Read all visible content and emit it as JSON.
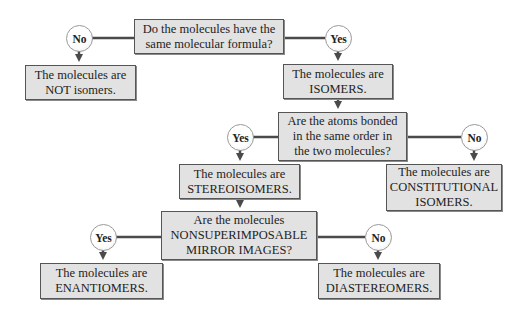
{
  "colors": {
    "box_fill": "#e2e2e2",
    "box_border": "#555555",
    "line": "#4a4a4a",
    "circle_fill": "#ffffff",
    "circle_border": "#9a9a9a",
    "text": "#222222"
  },
  "nodes": {
    "q1": {
      "lines": [
        "Do the molecules have the",
        "same molecular formula?"
      ]
    },
    "q1_no": {
      "label": "No"
    },
    "q1_yes": {
      "label": "Yes"
    },
    "not_isomers": {
      "lines": [
        "The molecules are",
        "NOT isomers."
      ]
    },
    "isomers": {
      "lines": [
        "The molecules are",
        "ISOMERS."
      ]
    },
    "q2": {
      "lines": [
        "Are the atoms bonded",
        "in the same order in",
        "the two molecules?"
      ]
    },
    "q2_yes": {
      "label": "Yes"
    },
    "q2_no": {
      "label": "No"
    },
    "stereoisomers": {
      "lines": [
        "The molecules are",
        "STEREOISOMERS."
      ]
    },
    "constitutional": {
      "lines": [
        "The molecules are",
        "CONSTITUTIONAL",
        "ISOMERS."
      ]
    },
    "q3": {
      "lines": [
        "Are the molecules",
        "NONSUPERIMPOSABLE",
        "MIRROR IMAGES?"
      ]
    },
    "q3_yes": {
      "label": "Yes"
    },
    "q3_no": {
      "label": "No"
    },
    "enantiomers": {
      "lines": [
        "The molecules are",
        "ENANTIOMERS."
      ]
    },
    "diastereomers": {
      "lines": [
        "The molecules are",
        "DIASTEREOMERS."
      ]
    }
  }
}
